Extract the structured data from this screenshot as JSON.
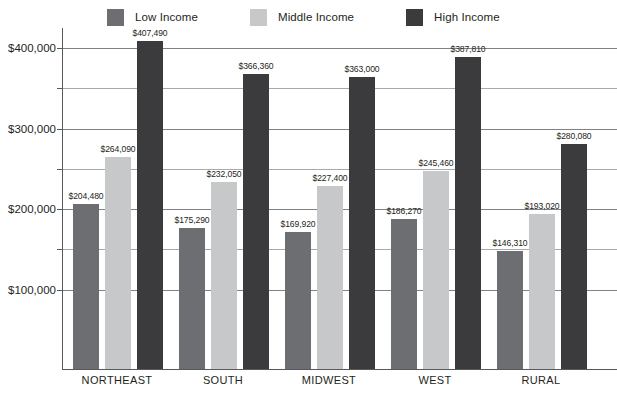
{
  "chart_data": {
    "type": "bar",
    "title": "",
    "xlabel": "",
    "ylabel": "",
    "categories": [
      "NORTHEAST",
      "SOUTH",
      "MIDWEST",
      "WEST",
      "RURAL"
    ],
    "series": [
      {
        "name": "Low Income",
        "color": "#6d6e71",
        "values": [
          204480,
          175290,
          169920,
          186270,
          146310
        ],
        "labels": [
          "$204,480",
          "$175,290",
          "$169,920",
          "$186,270",
          "$146,310"
        ]
      },
      {
        "name": "Middle Income",
        "color": "#c7c8ca",
        "values": [
          264090,
          232050,
          227400,
          245460,
          193020
        ],
        "labels": [
          "$264,090",
          "$232,050",
          "$227,400",
          "$245,460",
          "$193,020"
        ]
      },
      {
        "name": "High Income",
        "color": "#3b3b3d",
        "values": [
          407490,
          366360,
          363000,
          387810,
          280080
        ],
        "labels": [
          "$407,490",
          "$366,360",
          "$363,000",
          "$387,810",
          "$280,080"
        ]
      }
    ],
    "ylim": [
      0,
      425000
    ],
    "yticks": [
      100000,
      150000,
      200000,
      250000,
      300000,
      350000,
      400000
    ],
    "ytick_labels": [
      "$100,000",
      "",
      "$200,000",
      "",
      "$300,000",
      "",
      "$400,000"
    ],
    "ytick_major": [
      100000,
      200000,
      300000,
      400000
    ],
    "grid": true,
    "legend_position": "top",
    "value_labels": true
  },
  "legend": {
    "items": [
      {
        "label": "Low Income",
        "color": "#6d6e71"
      },
      {
        "label": "Middle Income",
        "color": "#c7c8ca"
      },
      {
        "label": "High Income",
        "color": "#3b3b3d"
      }
    ]
  },
  "axis": {
    "y_labels": [
      "$400,000",
      "$300,000",
      "$200,000",
      "$100,000"
    ],
    "x_labels": [
      "NORTHEAST",
      "SOUTH",
      "MIDWEST",
      "WEST",
      "RURAL"
    ]
  }
}
